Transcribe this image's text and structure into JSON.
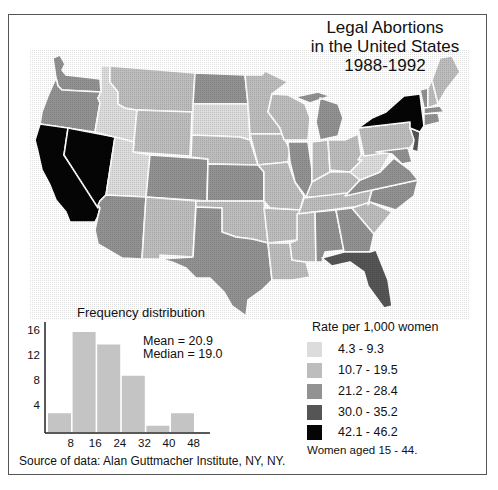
{
  "title": {
    "line1": "Legal Abortions",
    "line2": "in the United States",
    "line3": "1988-1992"
  },
  "colors": {
    "class1": "#dcdcdc",
    "class2": "#bdbdbd",
    "class3": "#929292",
    "class4": "#555555",
    "class5": "#050505",
    "border": "#ffffff",
    "histogram_bar": "#c4c4c4"
  },
  "legend": {
    "title": "Rate per 1,000 women",
    "items": [
      {
        "label": "4.3 - 9.3",
        "color": "#dcdcdc"
      },
      {
        "label": "10.7 - 19.5",
        "color": "#bdbdbd"
      },
      {
        "label": "21.2 - 28.4",
        "color": "#929292"
      },
      {
        "label": "30.0 - 35.2",
        "color": "#555555"
      },
      {
        "label": "42.1 - 46.2",
        "color": "#050505"
      }
    ],
    "note": "Women aged 15 - 44."
  },
  "histogram": {
    "title": "Frequency distribution",
    "mean_label": "Mean = 20.9",
    "median_label": "Median = 19.0"
  },
  "source": "Source of data: Alan Guttmacher Institute, NY, NY.",
  "chart_data": [
    {
      "type": "heatmap",
      "subtype": "choropleth",
      "title": "Legal Abortions in the United States 1988-1992",
      "legend_title": "Rate per 1,000 women",
      "legend_note": "Women aged 15 - 44.",
      "classes": [
        "4.3 - 9.3",
        "10.7 - 19.5",
        "21.2 - 28.4",
        "30.0 - 35.2",
        "42.1 - 46.2"
      ],
      "states_by_class": {
        "4.3 - 9.3": [
          "Idaho",
          "Utah",
          "South Dakota",
          "West Virginia"
        ],
        "10.7 - 19.5": [
          "Montana",
          "Wyoming",
          "Nebraska",
          "Minnesota",
          "Iowa",
          "Missouri",
          "Wisconsin",
          "Indiana",
          "Ohio",
          "Kentucky",
          "Tennessee",
          "Arkansas",
          "Louisiana",
          "Mississippi",
          "Oklahoma",
          "New Mexico",
          "South Carolina",
          "Maine",
          "New Hampshire",
          "Pennsylvania"
        ],
        "21.2 - 28.4": [
          "Washington",
          "Oregon",
          "Arizona",
          "Colorado",
          "North Dakota",
          "Kansas",
          "Texas",
          "Illinois",
          "Michigan",
          "Alabama",
          "Georgia",
          "Virginia",
          "North Carolina",
          "Vermont",
          "Massachusetts",
          "Connecticut",
          "Rhode Island",
          "Maryland",
          "Delaware"
        ],
        "30.0 - 35.2": [
          "Florida",
          "New Jersey"
        ],
        "42.1 - 46.2": [
          "California",
          "Nevada",
          "New York"
        ]
      }
    },
    {
      "type": "bar",
      "title": "Frequency distribution",
      "categories": [
        "0-8",
        "8-16",
        "16-24",
        "24-32",
        "32-40",
        "40-48"
      ],
      "bin_edges": [
        0,
        8,
        16,
        24,
        32,
        40,
        48
      ],
      "values": [
        3,
        16,
        14,
        9,
        1,
        3
      ],
      "xlabel": "",
      "ylabel": "",
      "x_ticks": [
        "8",
        "16",
        "24",
        "32",
        "40",
        "48"
      ],
      "y_ticks": [
        "4",
        "8",
        "12",
        "16"
      ],
      "ylim": [
        0,
        17
      ],
      "annotations": [
        "Mean = 20.9",
        "Median = 19.0"
      ],
      "grid": false
    }
  ]
}
